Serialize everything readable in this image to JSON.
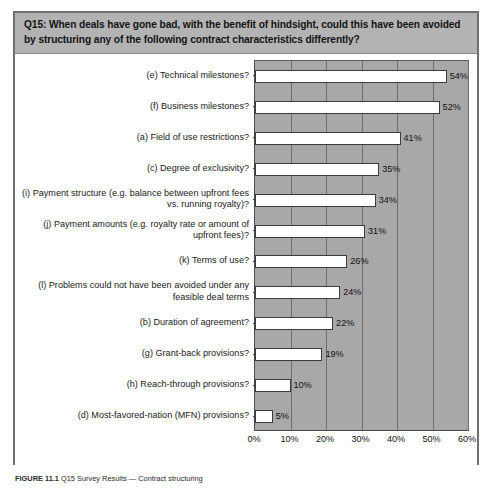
{
  "figure": {
    "question_header": "Q15: When deals have gone bad, with the benefit of hindsight, could this have been avoided by structuring any of the following contract characteristics differently?",
    "caption_label": "FIGURE 11.1",
    "caption_text": "Q15 Survey Results — Contract structuring",
    "frame_color": "#6f6f6f",
    "header_bg": "#b3b3b3",
    "plot_bg": "#a8a8a8",
    "bar_fill": "#ffffff",
    "bar_border": "#3c3c3c"
  },
  "chart_data": {
    "type": "bar",
    "orientation": "horizontal",
    "title": "Q15: When deals have gone bad, with the benefit of hindsight, could this have been avoided by structuring any of the following contract characteristics differently?",
    "xlabel": "",
    "ylabel": "",
    "xlim": [
      0,
      60
    ],
    "grid": true,
    "legend": "none",
    "value_suffix": "%",
    "categories": [
      "(e) Technical milestones?",
      "(f) Business milestones?",
      "(a) Field of use restrictions?",
      "(c) Degree of exclusivity?",
      "(i) Payment structure (e.g. balance between upfront fees vs. running royalty)?",
      "(j) Payment amounts (e.g. royalty rate or amount of upfront fees)?",
      "(k) Terms of use?",
      "(l) Problems could not have been avoided under any feasible deal terms",
      "(b) Duration of agreement?",
      "(g) Grant-back provisions?",
      "(h) Reach-through provisions?",
      "(d) Most-favored-nation (MFN) provisions?"
    ],
    "values": [
      54,
      52,
      41,
      35,
      34,
      31,
      26,
      24,
      22,
      19,
      10,
      5
    ],
    "value_labels": [
      "54%",
      "52%",
      "41%",
      "35%",
      "34%",
      "31%",
      "26%",
      "24%",
      "22%",
      "19%",
      "10%",
      "5%"
    ],
    "xticks": [
      0,
      10,
      20,
      30,
      40,
      50,
      60
    ],
    "xtick_labels": [
      "0%",
      "10%",
      "20%",
      "30%",
      "40%",
      "50%",
      "60%"
    ]
  }
}
